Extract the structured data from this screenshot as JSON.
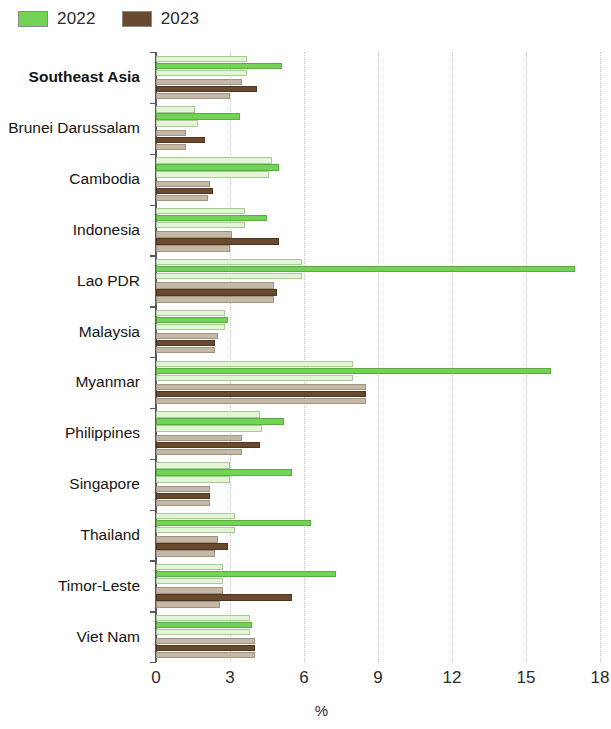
{
  "legend": {
    "items": [
      {
        "label": "2022",
        "color": "#72d356"
      },
      {
        "label": "2023",
        "color": "#6a4a2e"
      }
    ]
  },
  "axis": {
    "x_title": "%",
    "ticks": [
      "0",
      "3",
      "6",
      "9",
      "12",
      "15",
      "18"
    ]
  },
  "chart_data": {
    "type": "bar",
    "orientation": "horizontal",
    "title": "",
    "subtitle": "",
    "xlabel": "%",
    "ylabel": "",
    "xlim": [
      0,
      18
    ],
    "xticks": [
      0,
      3,
      6,
      9,
      12,
      15,
      18
    ],
    "grid": "vertical-dotted",
    "legend_position": "top-left",
    "legend": [
      "2022",
      "2023"
    ],
    "note": "Each year group is drawn as three stacked sub-bars (a pale outer bar, a saturated central bar, and a pale outer bar).",
    "categories": [
      "Southeast Asia",
      "Brunei Darussalam",
      "Cambodia",
      "Indonesia",
      "Lao PDR",
      "Malaysia",
      "Myanmar",
      "Philippines",
      "Singapore",
      "Thailand",
      "Timor-Leste",
      "Viet Nam"
    ],
    "series": [
      {
        "name": "2022",
        "color": "#72d356",
        "light_color": "#e2f5d4",
        "values": [
          5.1,
          3.4,
          5.0,
          4.5,
          17.0,
          2.9,
          16.0,
          5.2,
          5.5,
          6.3,
          7.3,
          3.9
        ],
        "values_upper": [
          3.7,
          1.6,
          4.7,
          3.6,
          5.9,
          2.8,
          8.0,
          4.2,
          3.0,
          3.2,
          2.7,
          3.8
        ],
        "values_lower": [
          3.7,
          1.7,
          4.6,
          3.6,
          5.9,
          2.8,
          8.0,
          4.3,
          3.0,
          3.2,
          2.7,
          3.8
        ]
      },
      {
        "name": "2023",
        "color": "#6a4a2e",
        "light_color": "#c6b8a6",
        "values": [
          4.1,
          2.0,
          2.3,
          5.0,
          4.9,
          2.4,
          8.5,
          4.2,
          2.2,
          2.9,
          5.5,
          4.0
        ],
        "values_upper": [
          3.5,
          1.2,
          2.2,
          3.1,
          4.8,
          2.5,
          8.5,
          3.5,
          2.2,
          2.5,
          2.7,
          4.0
        ],
        "values_lower": [
          3.0,
          1.2,
          2.1,
          3.0,
          4.8,
          2.4,
          8.5,
          3.5,
          2.2,
          2.4,
          2.6,
          4.0
        ]
      }
    ]
  }
}
